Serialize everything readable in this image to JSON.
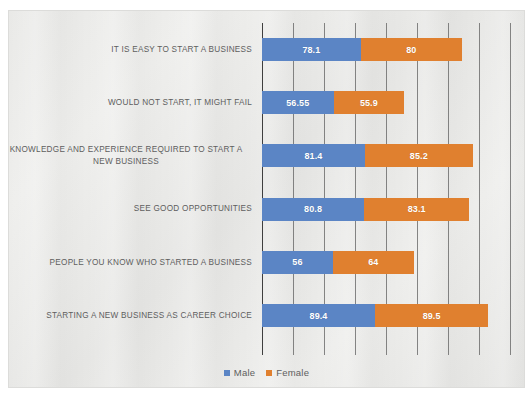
{
  "chart": {
    "type": "bar",
    "title": "",
    "legend_position": "bottom"
  },
  "legend": {
    "items": [
      {
        "label": "Male",
        "color": "#5B85C5",
        "swatch": "square-icon"
      },
      {
        "label": "Female",
        "color": "#E0802F",
        "swatch": "square-icon"
      }
    ]
  },
  "chart_data": {
    "type": "bar",
    "subtype": "stacked-horizontal-bar",
    "title": "",
    "subtitle": "",
    "xlabel": "",
    "ylabel": "",
    "xlim": [
      0,
      196
    ],
    "grid": true,
    "gridlines_x": [
      0,
      24.5,
      49,
      73.5,
      98,
      122.5,
      147,
      171.5,
      196
    ],
    "legend_position": "bottom",
    "categories": [
      "IT IS EASY TO START A BUSINESS",
      "WOULD NOT START, IT MIGHT FAIL",
      "KNOWLEDGE AND EXPERIENCE REQUIRED TO START A NEW BUSINESS",
      "SEE GOOD OPPORTUNITIES",
      "PEOPLE YOU KNOW WHO STARTED A BUSINESS",
      "STARTING A NEW BUSINESS AS CAREER CHOICE"
    ],
    "series": [
      {
        "name": "Male",
        "color": "#5B85C5",
        "values": [
          78.1,
          56.55,
          81.4,
          80.8,
          56,
          89.4
        ],
        "labels": [
          "78.1",
          "56.55",
          "81.4",
          "80.8",
          "56",
          "89.4"
        ]
      },
      {
        "name": "Female",
        "color": "#E0802F",
        "values": [
          80,
          55.9,
          85.2,
          83.1,
          64,
          89.5
        ],
        "labels": [
          "80",
          "55.9",
          "85.2",
          "83.1",
          "64",
          "89.5"
        ]
      }
    ],
    "totals": [
      158.1,
      112.45,
      166.6,
      163.9,
      120,
      178.9
    ]
  },
  "rows": [
    {
      "label": "IT IS EASY TO START A BUSINESS",
      "wrapped": false,
      "male": 78.1,
      "male_label": "78.1",
      "female": 80,
      "female_label": "80"
    },
    {
      "label": "WOULD NOT START, IT MIGHT FAIL",
      "wrapped": false,
      "male": 56.55,
      "male_label": "56.55",
      "female": 55.9,
      "female_label": "55.9"
    },
    {
      "label": "KNOWLEDGE AND EXPERIENCE REQUIRED TO START A\nNEW BUSINESS",
      "wrapped": true,
      "male": 81.4,
      "male_label": "81.4",
      "female": 85.2,
      "female_label": "85.2"
    },
    {
      "label": "SEE GOOD OPPORTUNITIES",
      "wrapped": false,
      "male": 80.8,
      "male_label": "80.8",
      "female": 83.1,
      "female_label": "83.1"
    },
    {
      "label": "PEOPLE YOU KNOW WHO STARTED A BUSINESS",
      "wrapped": false,
      "male": 56,
      "male_label": "56",
      "female": 64,
      "female_label": "64"
    },
    {
      "label": "STARTING A NEW BUSINESS AS CAREER CHOICE",
      "wrapped": false,
      "male": 89.4,
      "male_label": "89.4",
      "female": 89.5,
      "female_label": "89.5"
    }
  ],
  "colors": {
    "male": "#5B85C5",
    "female": "#E0802F",
    "label_text": "#5e5e5e",
    "gridline": "#5a5a5a",
    "panel_bg": "#e9e9e7"
  }
}
